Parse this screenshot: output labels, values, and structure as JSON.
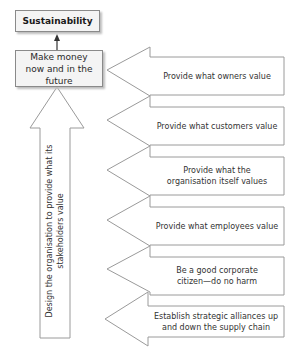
{
  "diagram": {
    "top_box": {
      "label": "Sustainability"
    },
    "goal_box": {
      "label": "Make money now and in the future"
    },
    "up_arrow": {
      "label": "Design the organisation to provide what its stakeholders value"
    },
    "arrows": [
      {
        "label": "Provide what owners value"
      },
      {
        "label": "Provide what customers value"
      },
      {
        "label": "Provide what the organisation itself values"
      },
      {
        "label": "Provide what employees value"
      },
      {
        "label": "Be a good corporate citizen—do no harm"
      },
      {
        "label": "Establish strategic alliances up and down the supply chain"
      }
    ],
    "colors": {
      "stroke": "#8a8a8a",
      "box_fill": "#f4f4f4",
      "text": "#2a2a2a"
    }
  }
}
